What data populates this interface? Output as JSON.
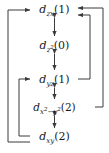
{
  "diagram": {
    "type": "orbital-coupling-diagram",
    "nodes": [
      {
        "id": "dzx",
        "orbital": "d",
        "subscript": "zx",
        "occupancy": "(1)",
        "label": "d_zx(1)"
      },
      {
        "id": "dz2",
        "orbital": "d",
        "subscript": "z",
        "subscript_exponent": "2",
        "occupancy": "(0)",
        "label": "d_z2(0)"
      },
      {
        "id": "dyz",
        "orbital": "d",
        "subscript": "yz",
        "occupancy": "(1)",
        "label": "d_yz(1)"
      },
      {
        "id": "dx2y2",
        "orbital": "d",
        "subscript_first": "x",
        "subscript_first_exponent": "2",
        "subscript_middle": "−y",
        "subscript_last_exponent": "2",
        "occupancy": "(2)",
        "label": "d_x2-y2(2)"
      },
      {
        "id": "dxy",
        "orbital": "d",
        "subscript": "xy",
        "occupancy": "(2)",
        "label": "d_xy(2)"
      }
    ],
    "vertical_links": [
      {
        "from": "dzx",
        "to": "dz2",
        "style": "double-headed-arrow"
      },
      {
        "from": "dz2",
        "to": "dyz",
        "style": "double-headed-arrow"
      },
      {
        "from": "dyz",
        "to": "dx2y2",
        "style": "double-headed-arrow"
      },
      {
        "from": "dx2y2",
        "to": "dxy",
        "style": "double-headed-arrow"
      }
    ],
    "routed_links": [
      {
        "from": "dx2y2",
        "to": "dzx",
        "side": "right",
        "track": "outer",
        "style": "single-headed-arrow"
      },
      {
        "from": "dyz",
        "to": "dzx",
        "side": "right",
        "track": "inner",
        "style": "single-headed-arrow"
      },
      {
        "from": "dxy",
        "to": "dzx",
        "side": "left",
        "track": "outer",
        "style": "single-headed-arrow"
      },
      {
        "from": "dxy",
        "to": "dyz",
        "side": "left",
        "track": "inner",
        "style": "single-headed-arrow"
      }
    ],
    "colors": {
      "stroke": "#3a3a3a",
      "text": "#1a1a1a",
      "background": "#ffffff"
    }
  }
}
